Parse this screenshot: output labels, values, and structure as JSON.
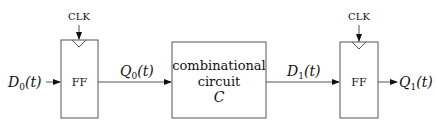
{
  "diagram": {
    "type": "sequential-circuit",
    "stroke_color": "#555555",
    "text_color": "#111111",
    "nodes": [
      {
        "id": "ff0",
        "label": "FF",
        "clock_label": "CLK"
      },
      {
        "id": "comb",
        "label_lines": [
          "combinational",
          "circuit",
          "C"
        ]
      },
      {
        "id": "ff1",
        "label": "FF",
        "clock_label": "CLK"
      }
    ],
    "signals": {
      "d0": {
        "name": "D",
        "sub": "0",
        "arg": "(t)"
      },
      "q0": {
        "name": "Q",
        "sub": "0",
        "arg": "(t)"
      },
      "d1": {
        "name": "D",
        "sub": "1",
        "arg": "(t)"
      },
      "q1": {
        "name": "Q",
        "sub": "1",
        "arg": "(t)"
      }
    },
    "edges": [
      {
        "from": "input",
        "to": "ff0",
        "label": "D0(t)"
      },
      {
        "from": "ff0",
        "to": "comb",
        "label": "Q0(t)"
      },
      {
        "from": "comb",
        "to": "ff1",
        "label": "D1(t)"
      },
      {
        "from": "ff1",
        "to": "output",
        "label": "Q1(t)"
      }
    ]
  }
}
